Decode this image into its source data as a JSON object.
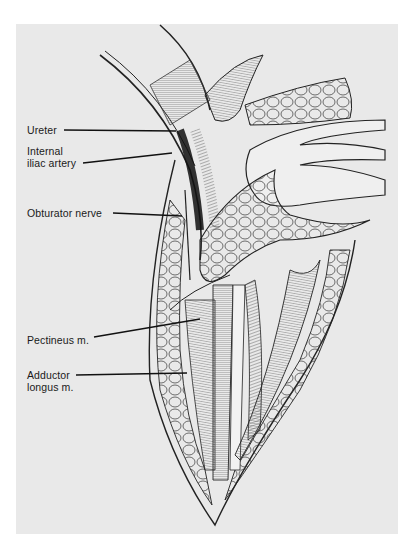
{
  "figure": {
    "background_color": "#e9e9e9",
    "line_color": "#1a1a1a",
    "labels": [
      {
        "id": "ureter",
        "lines": [
          "Ureter"
        ]
      },
      {
        "id": "internal-iliac-artery",
        "lines": [
          "Internal",
          "iliac artery"
        ]
      },
      {
        "id": "obturator-nerve",
        "lines": [
          "Obturator nerve"
        ]
      },
      {
        "id": "pectineus",
        "lines": [
          "Pectineus m."
        ]
      },
      {
        "id": "adductor-longus",
        "lines": [
          "Adductor",
          "longus m."
        ]
      }
    ]
  }
}
